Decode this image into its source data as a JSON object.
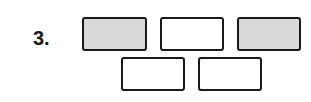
{
  "problem": {
    "number_label": "3."
  },
  "boxes": [
    {
      "row": 1,
      "shaded": true,
      "left": 82,
      "top": 17,
      "width": 65,
      "height": 34
    },
    {
      "row": 1,
      "shaded": false,
      "left": 160,
      "top": 17,
      "width": 64,
      "height": 34
    },
    {
      "row": 1,
      "shaded": true,
      "left": 237,
      "top": 17,
      "width": 64,
      "height": 34
    },
    {
      "row": 2,
      "shaded": false,
      "left": 121,
      "top": 57,
      "width": 64,
      "height": 34
    },
    {
      "row": 2,
      "shaded": false,
      "left": 198,
      "top": 57,
      "width": 64,
      "height": 34
    }
  ],
  "colors": {
    "border": "#1a1a1a",
    "shaded_fill": "#d9d9d9",
    "empty_fill": "#ffffff"
  }
}
